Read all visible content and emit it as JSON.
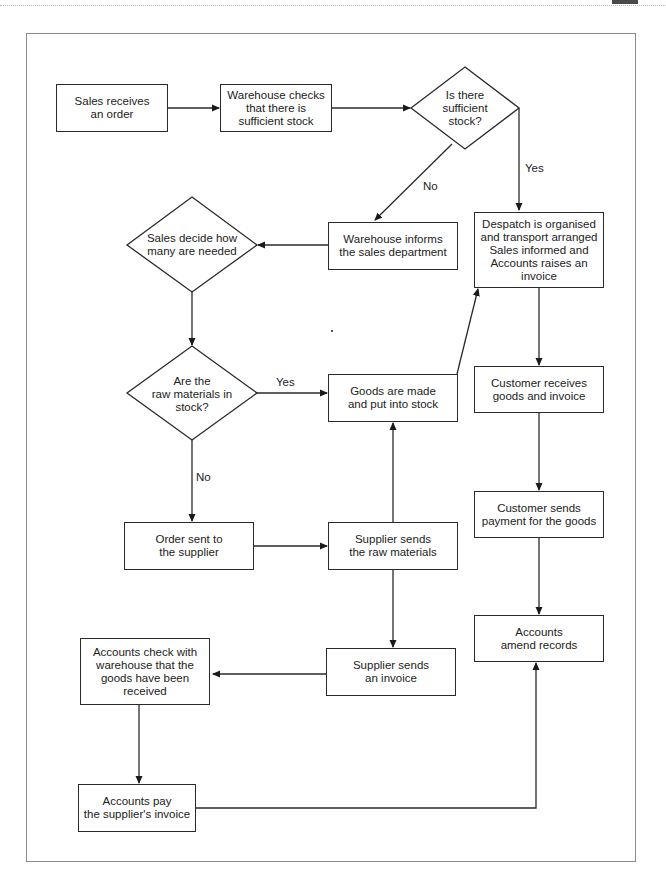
{
  "diagram": {
    "title": "",
    "nodes": {
      "sales_receives": "Sales receives\nan order",
      "warehouse_checks": "Warehouse checks\nthat there is\nsufficient stock",
      "sufficient_stock": "Is there\nsufficient\nstock?",
      "warehouse_informs": "Warehouse informs\nthe sales department",
      "sales_decide": "Sales decide how\nmany are needed",
      "despatch": "Despatch is organised\nand transport arranged\nSales informed and\nAccounts raises an\ninvoice",
      "raw_materials": "Are the\nraw materials in\nstock?",
      "goods_made": "Goods are made\nand put into stock",
      "customer_receives": "Customer receives\ngoods and invoice",
      "order_sent": "Order sent to\nthe supplier",
      "supplier_sends_raw": "Supplier sends\nthe raw materials",
      "customer_sends_payment": "Customer sends\npayment for the goods",
      "accounts_check": "Accounts check with\nwarehouse that the\ngoods have been\nreceived",
      "supplier_invoice": "Supplier sends\nan invoice",
      "accounts_amend": "Accounts\namend records",
      "accounts_pay": "Accounts pay\nthe supplier's invoice"
    },
    "edge_labels": {
      "stock_no": "No",
      "stock_yes": "Yes",
      "raw_yes": "Yes",
      "raw_no": "No"
    },
    "colors": {
      "stroke": "#2a2a2a",
      "frame": "#8a8a8a"
    }
  }
}
